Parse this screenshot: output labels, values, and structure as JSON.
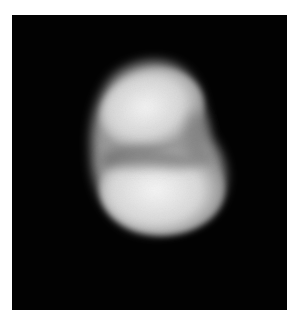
{
  "image": {
    "subject": "irregular bilobed bright body on black background",
    "background_color": "#020202",
    "page_color": "#ffffff",
    "body_highlight_color": "#f2f2f2",
    "body_shadow_color": "#6a6a6a"
  }
}
